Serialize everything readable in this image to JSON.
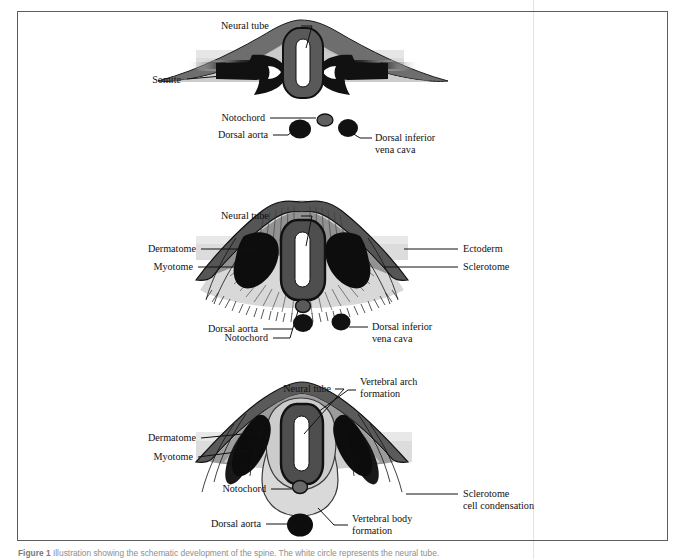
{
  "figure": {
    "frame": {
      "border_color": "#5d5d5d"
    },
    "column_rule_color": "#e3e3e3",
    "palette": {
      "black": "#111111",
      "dark_gray": "#5a5a5a",
      "mid_gray": "#8c8c8c",
      "light_gray": "#c9c9c9",
      "pale_gray": "#e0e0e0",
      "band_gray": "#dcdcdc",
      "white": "#ffffff"
    },
    "panels": [
      {
        "id": "panel-top",
        "name": "early-somite-stage",
        "labels": [
          {
            "key": "neural_tube",
            "text": "Neural tube"
          },
          {
            "key": "somite",
            "text": "Somite"
          },
          {
            "key": "notochord",
            "text": "Notochord"
          },
          {
            "key": "dorsal_aorta",
            "text": "Dorsal aorta"
          },
          {
            "key": "dorsal_ivc_l1",
            "text": "Dorsal inferior"
          },
          {
            "key": "dorsal_ivc_l2",
            "text": "vena cava"
          }
        ]
      },
      {
        "id": "panel-middle",
        "name": "sclerotome-migration-stage",
        "labels": [
          {
            "key": "neural_tube",
            "text": "Neural tube"
          },
          {
            "key": "dermatome",
            "text": "Dermatome"
          },
          {
            "key": "myotome",
            "text": "Myotome"
          },
          {
            "key": "ectoderm",
            "text": "Ectoderm"
          },
          {
            "key": "sclerotome",
            "text": "Sclerotome"
          },
          {
            "key": "notochord",
            "text": "Notochord"
          },
          {
            "key": "dorsal_aorta",
            "text": "Dorsal aorta"
          },
          {
            "key": "dorsal_ivc_l1",
            "text": "Dorsal inferior"
          },
          {
            "key": "dorsal_ivc_l2",
            "text": "vena cava"
          }
        ]
      },
      {
        "id": "panel-bottom",
        "name": "vertebra-formation-stage",
        "labels": [
          {
            "key": "neural_tube",
            "text": "Neural tube"
          },
          {
            "key": "vert_arch_l1",
            "text": "Vertebral arch"
          },
          {
            "key": "vert_arch_l2",
            "text": "formation"
          },
          {
            "key": "dermatome",
            "text": "Dermatome"
          },
          {
            "key": "myotome",
            "text": "Myotome"
          },
          {
            "key": "notochord",
            "text": "Notochord"
          },
          {
            "key": "sclerotome_cc_l1",
            "text": "Sclerotome"
          },
          {
            "key": "sclerotome_cc_l2",
            "text": "cell condensation"
          },
          {
            "key": "dorsal_aorta",
            "text": "Dorsal aorta"
          },
          {
            "key": "vert_body_l1",
            "text": "Vertebral body"
          },
          {
            "key": "vert_body_l2",
            "text": "formation"
          }
        ]
      }
    ]
  },
  "caption": {
    "lead": "Figure",
    "number": "1",
    "text": "Illustration showing the schematic development of the spine. The white circle represents the neural tube."
  }
}
